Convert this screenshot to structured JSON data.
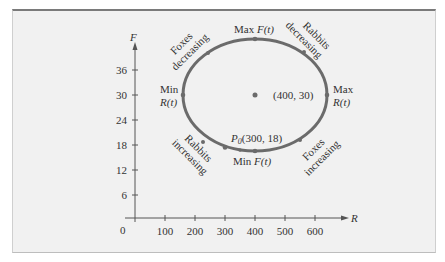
{
  "figure": {
    "axes": {
      "x_label": "R",
      "y_label": "F",
      "origin_label": "0",
      "x_ticks": [
        "100",
        "200",
        "300",
        "400",
        "500",
        "600"
      ],
      "y_ticks": [
        "6",
        "12",
        "18",
        "24",
        "30",
        "36"
      ]
    },
    "center": {
      "label": "(400, 30)"
    },
    "points": {
      "max_F": {
        "prefix": "Max ",
        "func": "F(t)"
      },
      "min_F": {
        "prefix": "Min ",
        "func": "F(t)"
      },
      "min_R": {
        "line1": "Min",
        "line2": "R(t)"
      },
      "max_R": {
        "line1": "Max",
        "line2": "R(t)"
      },
      "p0": {
        "name": "P",
        "sub": "0",
        "coords": "(300, 18)"
      }
    },
    "arcs": {
      "foxes_decreasing": [
        "Foxes",
        "decreasing"
      ],
      "rabbits_decreasing": [
        "Rabbits",
        "decreasing"
      ],
      "rabbits_increasing": [
        "Rabbits",
        "increasing"
      ],
      "foxes_increasing": [
        "Foxes",
        "increasing"
      ]
    },
    "colors": {
      "curve": "#6b6b6b",
      "axis": "#555555",
      "text": "#333333",
      "panel": "#f1f1f1"
    }
  }
}
